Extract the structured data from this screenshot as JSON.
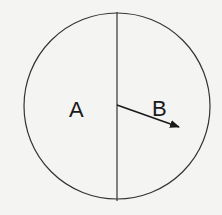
{
  "diagram": {
    "regions": [
      {
        "label": "A",
        "side": "left"
      },
      {
        "label": "B",
        "side": "right"
      }
    ],
    "circle": {
      "cx": 117,
      "cy": 106,
      "r": 93,
      "stroke": "#333333"
    },
    "divider": {
      "type": "vertical-line",
      "x": 117
    },
    "arrow": {
      "from": [
        117,
        105
      ],
      "to": [
        179,
        127
      ],
      "color": "#1a1a1a"
    }
  }
}
